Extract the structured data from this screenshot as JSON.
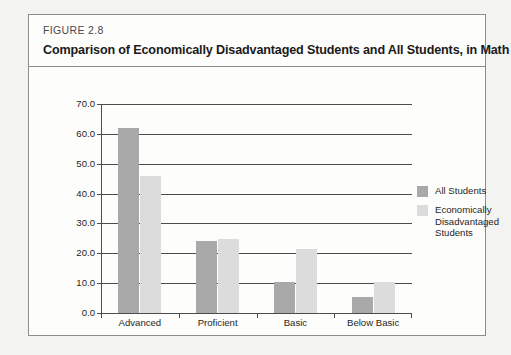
{
  "figure": {
    "number": "FIGURE 2.8",
    "title": "Comparison of Economically Disadvantaged Students and All Students, in Math"
  },
  "colors": {
    "all_students": "#a9a9a9",
    "econ_disadvantaged": "#dcdcdc",
    "axis": "#4c4c4c",
    "card_background": "#fdfdfc",
    "card_border": "#8d8d8d",
    "page_background": "#f3f3f1"
  },
  "legend": {
    "position": "right",
    "items": [
      {
        "label": "All Students",
        "color": "#a9a9a9"
      },
      {
        "label": "Economically Disadvantaged Students",
        "color": "#dcdcdc"
      }
    ]
  },
  "chart_data": {
    "type": "bar",
    "title": "Comparison of Economically Disadvantaged Students and All Students, in Math",
    "xlabel": "",
    "ylabel": "",
    "categories": [
      "Advanced",
      "Proficient",
      "Basic",
      "Below Basic"
    ],
    "series": [
      {
        "name": "All Students",
        "color": "#a9a9a9",
        "values": [
          62.0,
          24.2,
          10.5,
          5.5
        ]
      },
      {
        "name": "Economically Disadvantaged Students",
        "color": "#dcdcdc",
        "values": [
          46.0,
          24.7,
          21.5,
          10.3
        ]
      }
    ],
    "ylim": [
      0.0,
      70.0
    ],
    "ytick_interval": 10.0,
    "ytick_labels": [
      "0.0",
      "10.0",
      "20.0",
      "30.0",
      "40.0",
      "50.0",
      "60.0",
      "70.0"
    ],
    "grid": true,
    "legend_position": "right"
  }
}
